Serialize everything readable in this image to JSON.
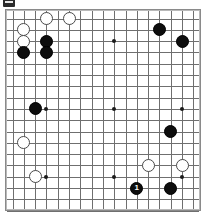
{
  "diagram": {
    "kind": "go-board-diagram",
    "board_size": 19,
    "visible_columns": 17,
    "visible_rows": 18,
    "origin_px": [
      12.5,
      18.5
    ],
    "spacing_px": 11.3,
    "stone_radius_px": 6.5,
    "colors": {
      "background": "#ffffff",
      "grid_line": "#6f6f6f",
      "board_border": "#8a8a8a",
      "black_stone": "#0d0d0d",
      "white_stone": "#ffffff",
      "white_stone_edge": "#4a4a4a",
      "star_point": "#1a1a1a",
      "black_label_text": "#ffffff"
    },
    "top_glyph": {
      "present": true,
      "name": "dark-tab-glyph",
      "color": "#2a2a2a"
    },
    "star_points": [
      {
        "col": 3,
        "row": 2
      },
      {
        "col": 9,
        "row": 2
      },
      {
        "col": 15,
        "row": 2
      },
      {
        "col": 3,
        "row": 8
      },
      {
        "col": 9,
        "row": 8
      },
      {
        "col": 15,
        "row": 8
      },
      {
        "col": 3,
        "row": 14
      },
      {
        "col": 9,
        "row": 14
      },
      {
        "col": 15,
        "row": 14
      }
    ],
    "stones": [
      {
        "color": "white",
        "col": 3,
        "row": 0,
        "label": ""
      },
      {
        "color": "white",
        "col": 5,
        "row": 0,
        "label": ""
      },
      {
        "color": "white",
        "col": 1,
        "row": 1,
        "label": ""
      },
      {
        "color": "white",
        "col": 1,
        "row": 2,
        "label": ""
      },
      {
        "color": "black",
        "col": 3,
        "row": 2,
        "label": ""
      },
      {
        "color": "black",
        "col": 1,
        "row": 3,
        "label": ""
      },
      {
        "color": "black",
        "col": 3,
        "row": 3,
        "label": ""
      },
      {
        "color": "black",
        "col": 13,
        "row": 1,
        "label": ""
      },
      {
        "color": "black",
        "col": 15,
        "row": 2,
        "label": ""
      },
      {
        "color": "black",
        "col": 2,
        "row": 8,
        "label": ""
      },
      {
        "color": "white",
        "col": 1,
        "row": 11,
        "label": ""
      },
      {
        "color": "black",
        "col": 14,
        "row": 10,
        "label": ""
      },
      {
        "color": "white",
        "col": 2,
        "row": 14,
        "label": ""
      },
      {
        "color": "white",
        "col": 12,
        "row": 13,
        "label": ""
      },
      {
        "color": "white",
        "col": 15,
        "row": 13,
        "label": ""
      },
      {
        "color": "black",
        "col": 11,
        "row": 15,
        "label": "1"
      },
      {
        "color": "black",
        "col": 14,
        "row": 15,
        "label": ""
      }
    ]
  }
}
